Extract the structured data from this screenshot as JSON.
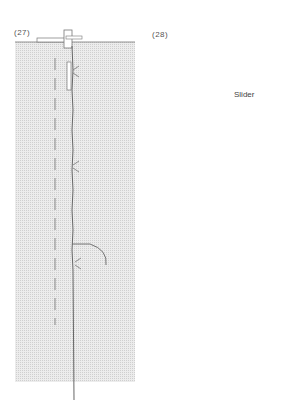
{
  "figure": {
    "panels": [
      {
        "id": "27",
        "label": "(27)"
      },
      {
        "id": "28",
        "label": "(28)",
        "callouts": [
          {
            "text": "Slider"
          }
        ],
        "arrow": "up"
      }
    ],
    "colors": {
      "fabric": "#e6e6e6",
      "line": "#666666",
      "background": "#ffffff"
    }
  }
}
